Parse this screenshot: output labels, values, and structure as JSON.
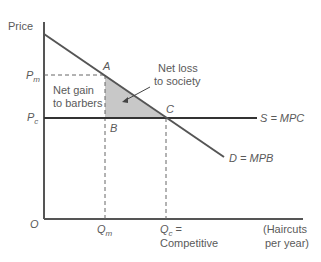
{
  "diagram": {
    "type": "economics-supply-demand",
    "y_axis_label": "Price",
    "origin_label": "O",
    "x_axis_label_line1": "(Haircuts",
    "x_axis_label_line2": "per year)",
    "price_labels": {
      "pm_main": "P",
      "pm_sub": "m",
      "pc_main": "P",
      "pc_sub": "c"
    },
    "quantity_labels": {
      "qm_main": "Q",
      "qm_sub": "m",
      "qc_main": "Q",
      "qc_sub": "c",
      "qc_suffix": " =",
      "qc_note": "Competitive"
    },
    "points": {
      "a": "A",
      "b": "B",
      "c": "C"
    },
    "curves": {
      "supply": "S = MPC",
      "demand": "D = MPB"
    },
    "annotations": {
      "gain_line1": "Net gain",
      "gain_line2": "to barbers",
      "loss_line1": "Net loss",
      "loss_line2": "to society"
    },
    "colors": {
      "axis": "#555555",
      "curve": "#555555",
      "supply": "#333333",
      "deadweight_fill": "#c8c8c8",
      "text": "#5a5a5a"
    }
  }
}
